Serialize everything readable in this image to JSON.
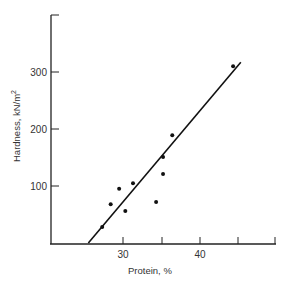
{
  "chart_data": {
    "type": "scatter",
    "title": "",
    "xlabel": "Protein, %",
    "ylabel": "Hardness, kN/m²",
    "xlim": [
      20,
      50
    ],
    "ylim": [
      0,
      400
    ],
    "x_ticks": [
      25,
      30,
      35,
      40,
      45,
      50
    ],
    "x_tick_labels": [
      "",
      "30",
      "",
      "40",
      "",
      ""
    ],
    "y_ticks": [
      100,
      200,
      300,
      400
    ],
    "y_tick_labels": [
      "100",
      "200",
      "300",
      ""
    ],
    "grid": false,
    "legend": null,
    "series": [
      {
        "name": "Samples",
        "marker": "dot",
        "points": [
          {
            "x": 27.3,
            "y": 28
          },
          {
            "x": 28.4,
            "y": 68
          },
          {
            "x": 29.5,
            "y": 95
          },
          {
            "x": 30.3,
            "y": 56
          },
          {
            "x": 31.3,
            "y": 105
          },
          {
            "x": 34.3,
            "y": 72
          },
          {
            "x": 35.2,
            "y": 121
          },
          {
            "x": 35.2,
            "y": 151
          },
          {
            "x": 36.4,
            "y": 189
          },
          {
            "x": 44.3,
            "y": 310
          }
        ]
      }
    ],
    "fit_line": {
      "x": [
        25.5,
        45.3
      ],
      "y": [
        0,
        317
      ]
    }
  },
  "labels": {
    "x_axis": "Protein, %",
    "y_axis": "Hardness, kN/m",
    "y_axis_sup": "2",
    "tick_30": "30",
    "tick_40": "40",
    "tick_100": "100",
    "tick_200": "200",
    "tick_300": "300"
  }
}
